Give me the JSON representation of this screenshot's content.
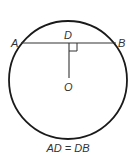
{
  "diagram": {
    "type": "geometry",
    "circle": {
      "cx": 68,
      "cy": 80,
      "r": 59,
      "stroke": "#1a1a1a"
    },
    "chord": {
      "from": "A",
      "to": "B",
      "y": 43,
      "x1": 22,
      "x2": 115
    },
    "perpendicular": {
      "from": "D",
      "to": "O",
      "x": 69,
      "y1": 43,
      "y2": 78
    },
    "right_angle_mark": {
      "x": 69,
      "y": 43,
      "size": 8
    },
    "points": {
      "A": {
        "label": "A"
      },
      "B": {
        "label": "B"
      },
      "D": {
        "label": "D"
      },
      "O": {
        "label": "O"
      }
    },
    "caption": "AD = DB"
  }
}
